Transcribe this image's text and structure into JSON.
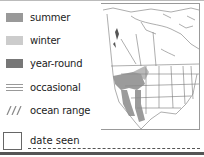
{
  "legend": {
    "items": [
      {
        "label": "summer",
        "color": "#999999",
        "type": "solid"
      },
      {
        "label": "winter",
        "color": "#cccccc",
        "type": "solid"
      },
      {
        "label": "year-round",
        "color": "#777777",
        "type": "solid"
      },
      {
        "label": "occasional",
        "color": "#888888",
        "type": "dotted"
      },
      {
        "label": "ocean range",
        "color": "#888888",
        "type": "hatched"
      }
    ]
  },
  "map": {
    "region": "North America",
    "range_color": "#8a8a8a"
  },
  "date": {
    "label": "date seen"
  }
}
